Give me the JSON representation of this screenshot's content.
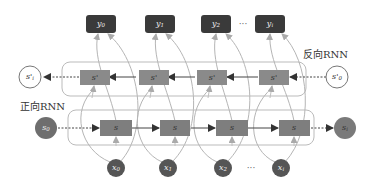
{
  "diagram": {
    "labels": {
      "backward": "反向RNN",
      "forward": "正向RNN"
    },
    "outputs": [
      "y0",
      "y1",
      "y2",
      "yi"
    ],
    "outputs_display": [
      {
        "base": "y",
        "sub": "0"
      },
      {
        "base": "y",
        "sub": "1"
      },
      {
        "base": "y",
        "sub": "2"
      },
      {
        "base": "y",
        "sub": "i"
      }
    ],
    "outputs_ellipsis": "···",
    "backward_states": [
      "s'",
      "s'",
      "s'",
      "s'"
    ],
    "backward_start": {
      "base": "s'",
      "sub": "0"
    },
    "backward_end": {
      "base": "s'",
      "sub": "i"
    },
    "forward_states": [
      "s",
      "s",
      "s",
      "s"
    ],
    "forward_start": {
      "base": "s",
      "sub": "0"
    },
    "forward_end": {
      "base": "s",
      "sub": "i"
    },
    "inputs_display": [
      {
        "base": "x",
        "sub": "0"
      },
      {
        "base": "x",
        "sub": "1"
      },
      {
        "base": "x",
        "sub": "2"
      },
      {
        "base": "x",
        "sub": "i"
      }
    ],
    "inputs_ellipsis": "···",
    "colors": {
      "output_box": "#3a3a3a",
      "state_box": "#8a8a8a",
      "input_circle": "#5a5a5a",
      "forward_end_circle": "#7a7a7a",
      "backward_circle_fill": "#ffffff",
      "arrow": "#444444",
      "curve": "#b0b0b0",
      "container": "#bbbbbb"
    }
  }
}
